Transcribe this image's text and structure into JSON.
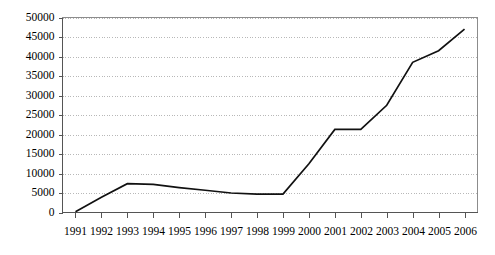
{
  "chart_data": {
    "type": "line",
    "title": "",
    "subtitle": "",
    "xlabel": "",
    "ylabel": "",
    "categories": [
      "1991",
      "1992",
      "1993",
      "1994",
      "1995",
      "1996",
      "1997",
      "1998",
      "1999",
      "2000",
      "2001",
      "2002",
      "2003",
      "2004",
      "2005",
      "2006"
    ],
    "x": [
      1991,
      1992,
      1993,
      1994,
      1995,
      1996,
      1997,
      1998,
      1999,
      2000,
      2001,
      2002,
      2003,
      2004,
      2005,
      2006
    ],
    "values": [
      200,
      3900,
      7400,
      7200,
      6400,
      5700,
      5000,
      4700,
      4700,
      12500,
      21300,
      21300,
      27500,
      38500,
      41500,
      47000
    ],
    "series": [
      {
        "name": "series-1",
        "values": [
          200,
          3900,
          7400,
          7200,
          6400,
          5700,
          5000,
          4700,
          4700,
          12500,
          21300,
          21300,
          27500,
          38500,
          41500,
          47000
        ],
        "color": "#111111"
      }
    ],
    "ylim": [
      0,
      50000
    ],
    "yticks": [
      0,
      5000,
      10000,
      15000,
      20000,
      25000,
      30000,
      35000,
      40000,
      45000,
      50000
    ],
    "ytick_labels": [
      "0",
      "5000",
      "10000",
      "15000",
      "20000",
      "25000",
      "30000",
      "35000",
      "40000",
      "45000",
      "50000"
    ],
    "xtick_labels": [
      "1991",
      "1992",
      "1993",
      "1994",
      "1995",
      "1996",
      "1997",
      "1998",
      "1999",
      "2000",
      "2001",
      "2002",
      "2003",
      "2004",
      "2005",
      "2006"
    ],
    "grid": "horizontal-dotted",
    "legend": "none",
    "legend_position": "none",
    "annotations": [],
    "colors": {
      "line": "#111111",
      "grid": "#9a9a9a",
      "axis": "#555555",
      "frame": "#8c8c8c",
      "background": "#ffffff",
      "text": "#000000"
    }
  }
}
